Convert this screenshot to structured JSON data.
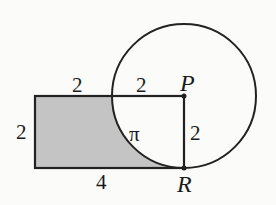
{
  "diagram": {
    "shapes": {
      "rectangle": {
        "width_label": "4",
        "height_label": "2",
        "fill": "#c4c4c4",
        "stroke": "#222222"
      },
      "circle": {
        "center": "P",
        "radius_label": "2",
        "stroke": "#222222"
      }
    },
    "labels": {
      "top_left_segment": "2",
      "top_right_segment": "2",
      "left_side": "2",
      "bottom_side": "4",
      "radius_PR": "2",
      "region_inside": "π",
      "point_P": "P",
      "point_R": "R"
    },
    "colors": {
      "shaded": "#c4c4c4",
      "line": "#222222",
      "background": "#fbfbf9"
    }
  }
}
